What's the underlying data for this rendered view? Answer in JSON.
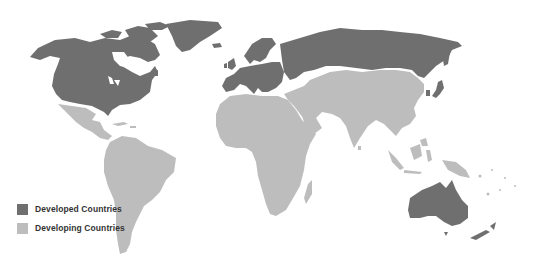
{
  "map": {
    "title": "",
    "type": "world-choropleth",
    "colors": {
      "developed": "#6f6f6f",
      "developing": "#bdbdbd",
      "background": "#ffffff",
      "border": "#d0d0d0"
    },
    "categories": {
      "developed": [
        "United States",
        "Canada",
        "Greenland",
        "Europe",
        "Russia",
        "Japan",
        "South Korea",
        "Australia",
        "New Zealand"
      ],
      "developing": [
        "Mexico",
        "Central America",
        "Caribbean",
        "South America",
        "Africa",
        "Middle East",
        "Central Asia",
        "China",
        "Mongolia",
        "South Asia",
        "Southeast Asia",
        "Papua New Guinea",
        "Pacific Islands"
      ]
    }
  },
  "legend": {
    "items": [
      {
        "label": "Developed Countries",
        "color": "#6f6f6f"
      },
      {
        "label": "Developing Countries",
        "color": "#bdbdbd"
      }
    ]
  }
}
